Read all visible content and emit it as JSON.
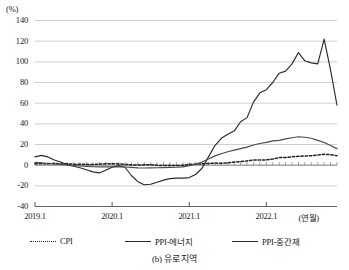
{
  "chart_data": {
    "type": "line",
    "title": "",
    "caption": "(b) 유로 지역",
    "unit_label": "(%)",
    "xlabel": "(연월)",
    "ylabel": "",
    "ylim": [
      -40,
      140
    ],
    "ytick_labels": [
      "140",
      "120",
      "100",
      "80",
      "60",
      "40",
      "20",
      "0",
      "-20",
      "-40"
    ],
    "ytick_values": [
      140,
      120,
      100,
      80,
      60,
      40,
      20,
      0,
      -20,
      -40
    ],
    "xtick_labels": [
      "2019.1",
      "2020.1",
      "2021.1",
      "2022.1"
    ],
    "xtick_values": [
      0,
      12,
      24,
      36
    ],
    "grid": true,
    "legend_position": "bottom",
    "x": [
      "2019.1",
      "2019.2",
      "2019.3",
      "2019.4",
      "2019.5",
      "2019.6",
      "2019.7",
      "2019.8",
      "2019.9",
      "2019.10",
      "2019.11",
      "2019.12",
      "2020.1",
      "2020.2",
      "2020.3",
      "2020.4",
      "2020.5",
      "2020.6",
      "2020.7",
      "2020.8",
      "2020.9",
      "2020.10",
      "2020.11",
      "2020.12",
      "2021.1",
      "2021.2",
      "2021.3",
      "2021.4",
      "2021.5",
      "2021.6",
      "2021.7",
      "2021.8",
      "2021.9",
      "2021.10",
      "2021.11",
      "2021.12",
      "2022.1",
      "2022.2",
      "2022.3",
      "2022.4",
      "2022.5",
      "2022.6",
      "2022.7",
      "2022.8",
      "2022.9",
      "2022.10",
      "2022.11",
      "2022.12"
    ],
    "series": [
      {
        "name": "CPI",
        "style": "dotted",
        "color": "#222222",
        "values": [
          1.4,
          1.5,
          1.4,
          1.7,
          1.2,
          1.3,
          1.0,
          1.0,
          0.8,
          0.7,
          1.0,
          1.3,
          1.4,
          1.2,
          0.7,
          0.3,
          0.1,
          0.3,
          0.4,
          -0.2,
          -0.3,
          -0.3,
          -0.3,
          -0.3,
          0.9,
          0.9,
          1.3,
          1.6,
          2.0,
          1.9,
          2.2,
          3.0,
          3.4,
          4.1,
          4.9,
          5.0,
          5.1,
          5.9,
          7.4,
          7.4,
          8.1,
          8.6,
          8.9,
          9.1,
          9.9,
          10.6,
          10.1,
          9.2
        ]
      },
      {
        "name": "PPI-에너지",
        "style": "solid",
        "color": "#2b2b2b",
        "values": [
          8.0,
          9.5,
          8.0,
          5.0,
          3.0,
          0.5,
          -1.0,
          -2.5,
          -4.5,
          -6.5,
          -7.5,
          -5.0,
          -2.0,
          -0.5,
          -2.0,
          -10.0,
          -16.0,
          -19.0,
          -18.5,
          -16.5,
          -14.5,
          -13.0,
          -12.5,
          -12.5,
          -12.0,
          -9.0,
          -3.0,
          8.0,
          19.0,
          26.0,
          30.0,
          33.0,
          42.0,
          46.0,
          61.0,
          70.0,
          73.0,
          80.0,
          89.0,
          91.0,
          98.0,
          109.0,
          101.0,
          99.0,
          98.0,
          122.0,
          92.0,
          58.0
        ]
      },
      {
        "name": "PPI-중간재",
        "style": "solid",
        "color": "#4a4a4a",
        "values": [
          2.8,
          2.2,
          1.6,
          1.2,
          0.8,
          0.2,
          -0.3,
          -0.8,
          -1.2,
          -1.5,
          -1.6,
          -1.7,
          -1.5,
          -1.6,
          -1.8,
          -2.2,
          -2.6,
          -2.7,
          -2.6,
          -2.5,
          -2.4,
          -2.2,
          -2.0,
          -1.6,
          -0.5,
          1.0,
          3.0,
          6.0,
          9.0,
          11.0,
          13.0,
          14.5,
          16.0,
          17.5,
          19.5,
          21.0,
          22.0,
          23.5,
          24.0,
          25.5,
          26.5,
          27.5,
          27.0,
          26.0,
          24.0,
          22.0,
          19.0,
          16.0
        ]
      }
    ]
  },
  "axes": {
    "unit": "(%)",
    "x_unit": "(연월)"
  },
  "legend": {
    "items": [
      {
        "label": "CPI",
        "style": "dotted"
      },
      {
        "label": "PPI-에너지",
        "style": "solid"
      },
      {
        "label": "PPI-중간재",
        "style": "solid"
      }
    ]
  },
  "caption": "(b) 유로 지역"
}
